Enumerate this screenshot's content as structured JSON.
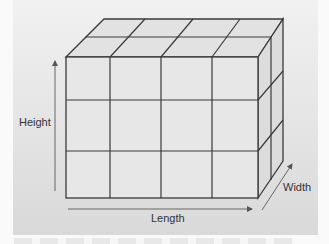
{
  "diagram": {
    "type": "3d-cube-grid",
    "grid": {
      "length_units": 4,
      "height_units": 3,
      "width_units": 2
    },
    "labels": {
      "height": "Height",
      "length": "Length",
      "width": "Width"
    },
    "colors": {
      "panel_top": "#f1f1f1",
      "panel_bottom": "#d9d9d9",
      "face_front": "#e7e7e7",
      "face_top": "#e2e2e2",
      "face_right": "#dcdcdc",
      "edge": "#3a3a3a",
      "arrow": "#555555"
    }
  }
}
